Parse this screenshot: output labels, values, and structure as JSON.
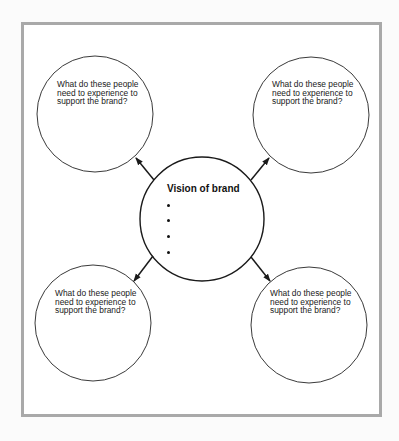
{
  "diagram": {
    "type": "hub-and-spoke",
    "frame_color": "#a9a9a9",
    "line_color": "#1a1a1a",
    "center": {
      "title": "Vision of brand",
      "bullets": [
        "",
        "",
        "",
        ""
      ]
    },
    "nodes": [
      {
        "position": "top-left",
        "text": "What do these people\nneed to experience to\nsupport the brand?"
      },
      {
        "position": "top-right",
        "text": "What do these people\nneed to experience to\nsupport the brand?"
      },
      {
        "position": "bottom-left",
        "text": "What do these people\nneed to experience to\nsupport the brand?"
      },
      {
        "position": "bottom-right",
        "text": "What do these people\nneed to experience to\nsupport the brand?"
      }
    ],
    "edges": [
      {
        "from": "center",
        "to": "top-left",
        "arrow": "to"
      },
      {
        "from": "center",
        "to": "top-right",
        "arrow": "to"
      },
      {
        "from": "center",
        "to": "bottom-left",
        "arrow": "to"
      },
      {
        "from": "center",
        "to": "bottom-right",
        "arrow": "to"
      }
    ]
  }
}
